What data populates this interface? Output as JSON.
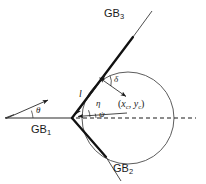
{
  "figure": {
    "background_color": "#ffffff",
    "stroke_color": "#1a1a1a",
    "thin_stroke_color": "#555555",
    "width": 206,
    "height": 184
  },
  "labels": {
    "gb1": "GB",
    "gb1_sub": "1",
    "gb2": "GB",
    "gb2_sub": "2",
    "gb3": "GB",
    "gb3_sub": "3",
    "theta": "θ",
    "delta": "δ",
    "eta": "η",
    "psi": "ψ",
    "length": "l",
    "center_open": "(",
    "center_x": "x",
    "center_x_sub": "c",
    "center_comma": ", ",
    "center_y": "y",
    "center_y_sub": "c",
    "center_close": ")"
  },
  "geometry": {
    "circle": {
      "cx": 128,
      "cy": 118,
      "r": 46
    },
    "junction": {
      "x": 72,
      "y": 118
    },
    "center_point": {
      "x": 128,
      "y": 118
    },
    "gb1_line": {
      "x1": 5,
      "y1": 118,
      "x2": 72,
      "y2": 118
    },
    "gb3_line": {
      "x1": 72,
      "y1": 118,
      "x2": 152,
      "y2": 12
    },
    "gb2_line": {
      "x1": 72,
      "y1": 118,
      "x2": 120,
      "y2": 180
    },
    "dashed_line": {
      "x1": 74,
      "y1": 118,
      "x2": 196,
      "y2": 118
    },
    "theta_arrow": {
      "x1": 5,
      "y1": 118,
      "x2": 50,
      "y2": 100
    },
    "eta_arrow": {
      "from": {
        "x": 126,
        "y": 114
      },
      "to": {
        "x": 76,
        "y": 116
      }
    },
    "delta_arrow": {
      "from": {
        "x": 103,
        "y": 80
      },
      "to": {
        "x": 126,
        "y": 96
      }
    },
    "l_arrow": {
      "x1": 75,
      "y1": 113,
      "x2": 106,
      "y2": 72
    }
  }
}
